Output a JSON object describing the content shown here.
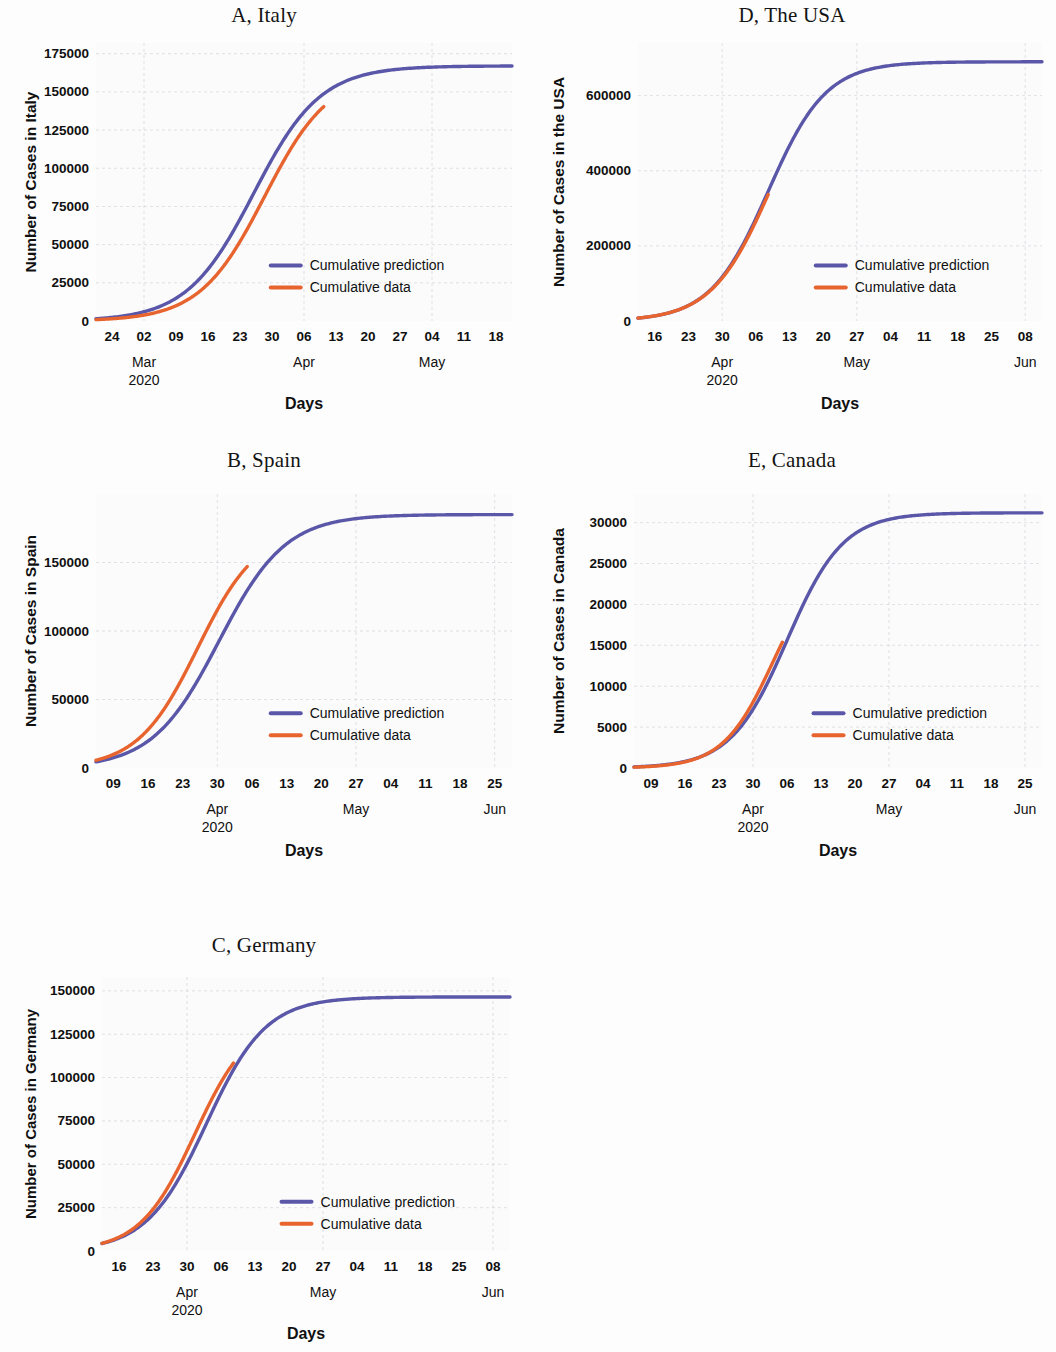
{
  "figure": {
    "colors": {
      "prediction": "#5a57a8",
      "data": "#e8642f",
      "grid": "#c9c9d2",
      "text": "#101010",
      "background": "#fdfdfd"
    },
    "legend_labels": {
      "prediction": "Cumulative prediction",
      "data": "Cumulative data"
    },
    "xlabel": "Days"
  },
  "chart_data": [
    {
      "type": "line",
      "panel": "A",
      "title": "A, Italy",
      "country": "Italy",
      "ylabel": "Number of Cases in Italy",
      "xlabel": "Days",
      "legend_position": "center-right",
      "grid": true,
      "ylim": [
        0,
        182000
      ],
      "yticks": [
        0,
        25000,
        50000,
        75000,
        100000,
        125000,
        150000,
        175000
      ],
      "ytick_labels": [
        "0",
        "25000",
        "50000",
        "75000",
        "100000",
        "125000",
        "150000",
        "175000"
      ],
      "xticks": [
        "24",
        "02",
        "09",
        "16",
        "23",
        "30",
        "06",
        "13",
        "20",
        "27",
        "04",
        "11",
        "18"
      ],
      "month_labels": [
        {
          "text": "Mar",
          "tick_index": 1
        },
        {
          "text": "2020",
          "tick_index": 1
        },
        {
          "text": "Apr",
          "tick_index": 6
        },
        {
          "text": "May",
          "tick_index": 10
        }
      ],
      "x_start_day": 24,
      "x_days_total": 95,
      "series": [
        {
          "name": "Cumulative prediction",
          "color": "#5a57a8",
          "model": "logistic",
          "L": 167000,
          "k": 0.131,
          "x0": 36,
          "x_from": 0,
          "x_to": 95
        },
        {
          "name": "Cumulative data",
          "color": "#e8642f",
          "model": "logistic",
          "L": 163000,
          "k": 0.135,
          "x0": 38.5,
          "x_from": 0,
          "x_to": 52
        }
      ]
    },
    {
      "type": "line",
      "panel": "D",
      "title": "D, The USA",
      "country": "The USA",
      "ylabel": "Number of Cases in the USA",
      "xlabel": "Days",
      "legend_position": "center-right",
      "grid": true,
      "ylim": [
        0,
        740000
      ],
      "yticks": [
        0,
        200000,
        400000,
        600000
      ],
      "ytick_labels": [
        "0",
        "200000",
        "400000",
        "600000"
      ],
      "xticks": [
        "16",
        "23",
        "30",
        "06",
        "13",
        "20",
        "27",
        "04",
        "11",
        "18",
        "25",
        "08"
      ],
      "month_labels": [
        {
          "text": "Apr",
          "tick_index": 2
        },
        {
          "text": "2020",
          "tick_index": 2
        },
        {
          "text": "May",
          "tick_index": 6
        },
        {
          "text": "Jun",
          "tick_index": 11
        }
      ],
      "x_start_day": 16,
      "x_days_total": 90,
      "series": [
        {
          "name": "Cumulative prediction",
          "color": "#5a57a8",
          "model": "logistic",
          "L": 690000,
          "k": 0.155,
          "x0": 29,
          "x_from": 0,
          "x_to": 90
        },
        {
          "name": "Cumulative data",
          "color": "#e8642f",
          "model": "logistic",
          "L": 700000,
          "k": 0.152,
          "x0": 29.5,
          "x_from": 0,
          "x_to": 29
        }
      ]
    },
    {
      "type": "line",
      "panel": "B",
      "title": "B, Spain",
      "country": "Spain",
      "ylabel": "Number of Cases in Spain",
      "xlabel": "Days",
      "legend_position": "center-right",
      "grid": true,
      "ylim": [
        0,
        200000
      ],
      "yticks": [
        0,
        50000,
        100000,
        150000
      ],
      "ytick_labels": [
        "0",
        "50000",
        "100000",
        "150000"
      ],
      "xticks": [
        "09",
        "16",
        "23",
        "30",
        "06",
        "13",
        "20",
        "27",
        "04",
        "11",
        "18",
        "25"
      ],
      "month_labels": [
        {
          "text": "Apr",
          "tick_index": 3
        },
        {
          "text": "2020",
          "tick_index": 3
        },
        {
          "text": "May",
          "tick_index": 7
        },
        {
          "text": "Jun",
          "tick_index": 11
        }
      ],
      "x_start_day": 9,
      "x_days_total": 88,
      "series": [
        {
          "name": "Cumulative prediction",
          "color": "#5a57a8",
          "model": "logistic",
          "L": 185000,
          "k": 0.142,
          "x0": 26,
          "x_from": 0,
          "x_to": 88
        },
        {
          "name": "Cumulative data",
          "color": "#e8642f",
          "model": "logistic",
          "L": 175000,
          "k": 0.158,
          "x0": 21.5,
          "x_from": 0,
          "x_to": 32
        }
      ]
    },
    {
      "type": "line",
      "panel": "E",
      "title": "E, Canada",
      "country": "Canada",
      "ylabel": "Number of Cases in Canada",
      "xlabel": "Days",
      "legend_position": "center-right",
      "grid": true,
      "ylim": [
        0,
        33500
      ],
      "yticks": [
        0,
        5000,
        10000,
        15000,
        20000,
        25000,
        30000
      ],
      "ytick_labels": [
        "0",
        "5000",
        "10000",
        "15000",
        "20000",
        "25000",
        "30000"
      ],
      "xticks": [
        "09",
        "16",
        "23",
        "30",
        "06",
        "13",
        "20",
        "27",
        "04",
        "11",
        "18",
        "25"
      ],
      "month_labels": [
        {
          "text": "Apr",
          "tick_index": 3
        },
        {
          "text": "2020",
          "tick_index": 3
        },
        {
          "text": "May",
          "tick_index": 7
        },
        {
          "text": "Jun",
          "tick_index": 11
        }
      ],
      "x_start_day": 9,
      "x_days_total": 88,
      "series": [
        {
          "name": "Cumulative prediction",
          "color": "#5a57a8",
          "model": "logistic",
          "L": 31200,
          "k": 0.165,
          "x0": 33,
          "x_from": 0,
          "x_to": 88
        },
        {
          "name": "Cumulative data",
          "color": "#e8642f",
          "model": "logistic",
          "L": 26000,
          "k": 0.185,
          "x0": 30,
          "x_from": 0,
          "x_to": 32
        }
      ]
    },
    {
      "type": "line",
      "panel": "C",
      "title": "C, Germany",
      "country": "Germany",
      "ylabel": "Number of Cases in Germany",
      "xlabel": "Days",
      "legend_position": "center-right",
      "grid": true,
      "ylim": [
        0,
        158000
      ],
      "yticks": [
        0,
        25000,
        50000,
        75000,
        100000,
        125000,
        150000
      ],
      "ytick_labels": [
        "0",
        "25000",
        "50000",
        "75000",
        "100000",
        "125000",
        "150000"
      ],
      "xticks": [
        "16",
        "23",
        "30",
        "06",
        "13",
        "20",
        "27",
        "04",
        "11",
        "18",
        "25",
        "08"
      ],
      "month_labels": [
        {
          "text": "Apr",
          "tick_index": 2
        },
        {
          "text": "2020",
          "tick_index": 2
        },
        {
          "text": "May",
          "tick_index": 6
        },
        {
          "text": "Jun",
          "tick_index": 11
        }
      ],
      "x_start_day": 16,
      "x_days_total": 90,
      "series": [
        {
          "name": "Cumulative prediction",
          "color": "#5a57a8",
          "model": "logistic",
          "L": 146500,
          "k": 0.152,
          "x0": 23,
          "x_from": 0,
          "x_to": 90
        },
        {
          "name": "Cumulative data",
          "color": "#e8642f",
          "model": "logistic",
          "L": 135000,
          "k": 0.165,
          "x0": 20.5,
          "x_from": 0,
          "x_to": 29
        }
      ]
    }
  ]
}
